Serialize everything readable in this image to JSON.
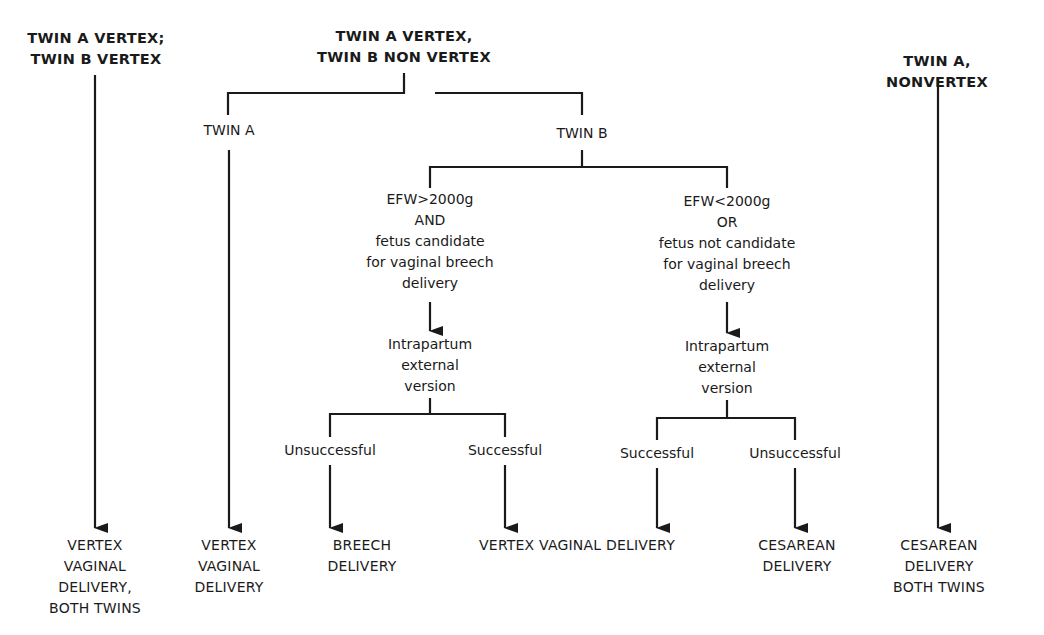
{
  "diagram": {
    "type": "decision-flowchart",
    "scenarios": [
      {
        "id": "vertex-vertex",
        "heading": "TWIN A VERTEX;\nTWIN B VERTEX",
        "outcome": "VERTEX\nVAGINAL\nDELIVERY,\nBOTH TWINS"
      },
      {
        "id": "vertex-nonvertex",
        "heading": "TWIN A VERTEX,\nTWIN B NON VERTEX",
        "branches": {
          "twin_a": {
            "label": "TWIN A",
            "outcome": "VERTEX\nVAGINAL\nDELIVERY"
          },
          "twin_b": {
            "label": "TWIN B",
            "conditions": [
              {
                "criteria": "EFW>2000g\nAND\nfetus candidate\nfor vaginal breech\ndelivery",
                "procedure": "Intrapartum\nexternal\nversion",
                "results": [
                  {
                    "label": "Unsuccessful",
                    "outcome": "BREECH\nDELIVERY"
                  },
                  {
                    "label": "Successful",
                    "outcome": "VERTEX VAGINAL DELIVERY"
                  }
                ]
              },
              {
                "criteria": "EFW<2000g\nOR\nfetus not candidate\nfor vaginal breech\ndelivery",
                "procedure": "Intrapartum\nexternal\nversion",
                "results": [
                  {
                    "label": "Successful",
                    "outcome": "VERTEX VAGINAL DELIVERY"
                  },
                  {
                    "label": "Unsuccessful",
                    "outcome": "CESAREAN\nDELIVERY"
                  }
                ]
              }
            ]
          }
        }
      },
      {
        "id": "nonvertex",
        "heading": "TWIN A, NONVERTEX",
        "outcome": "CESAREAN\nDELIVERY\nBOTH TWINS"
      }
    ],
    "shared_outcome_label": "VERTEX VAGINAL DELIVERY"
  },
  "colors": {
    "ink": "#1a1a1a",
    "background": "#ffffff"
  }
}
